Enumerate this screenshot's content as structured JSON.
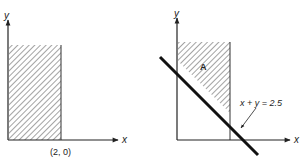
{
  "left_panel": {
    "x_axis_label": "x",
    "y_axis_label": "y",
    "point_label": "(2, 0)",
    "shaded_region": "0 ≤ x ≤ 2, y ≥ 0"
  },
  "right_panel": {
    "x_axis_label": "x",
    "y_axis_label": "y",
    "region_label": "A",
    "line_label": "x + y = 2.5",
    "shaded_region": "0 ≤ x ≤ 2, x + y ≥ 2.5"
  },
  "colors": {
    "ink": "#222222",
    "background": "#ffffff"
  }
}
